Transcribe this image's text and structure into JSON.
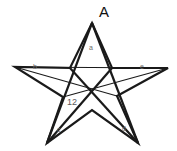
{
  "figure": {
    "title_label": "A",
    "stroke_color": "#1a1a1a",
    "fill_color": "#ffffff",
    "background": "#ffffff",
    "shape": "five-pointed-star-pentagram"
  },
  "labels": {
    "apex": "A",
    "top_triangle": "a",
    "left_arm": "b",
    "right_arm": "e",
    "bottom_left_leg": "c",
    "bottom_right_leg": "d",
    "measure": "12"
  },
  "geometry": {
    "outer_points": [
      {
        "name": "apex",
        "x": 92,
        "y": 23
      },
      {
        "name": "right-tip",
        "x": 168,
        "y": 68
      },
      {
        "name": "bottom-right-tip",
        "x": 138,
        "y": 143
      },
      {
        "name": "bottom-left-tip",
        "x": 47,
        "y": 143
      },
      {
        "name": "left-tip",
        "x": 15,
        "y": 67
      }
    ],
    "inner_points": [
      {
        "name": "inner-upper-left",
        "x": 70,
        "y": 68
      },
      {
        "name": "inner-upper-right",
        "x": 112,
        "y": 68
      },
      {
        "name": "inner-lower-right",
        "x": 117,
        "y": 96
      },
      {
        "name": "inner-bottom",
        "x": 92,
        "y": 110
      },
      {
        "name": "inner-lower-left",
        "x": 63,
        "y": 97
      }
    ]
  }
}
